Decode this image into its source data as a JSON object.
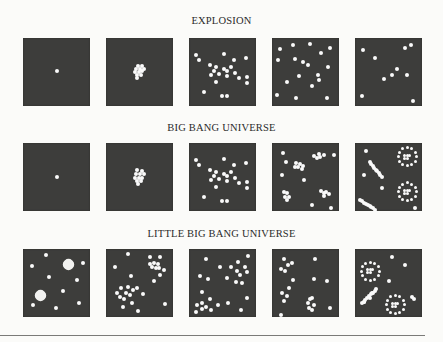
{
  "rows": [
    {
      "title": "EXPLOSION",
      "panels": [
        {
          "dots": [
            [
              50,
              49
            ]
          ]
        },
        {
          "dots": [
            [
              48,
              41
            ],
            [
              53,
              41
            ],
            [
              45,
              46
            ],
            [
              51,
              46
            ],
            [
              56,
              45
            ],
            [
              43,
              50
            ],
            [
              49,
              50
            ],
            [
              54,
              49
            ],
            [
              47,
              55
            ],
            [
              52,
              54
            ],
            [
              46,
              59
            ]
          ]
        },
        {
          "dots": [
            [
              11,
              25
            ],
            [
              15,
              32
            ],
            [
              52,
              23
            ],
            [
              67,
              33
            ],
            [
              85,
              29
            ],
            [
              31,
              39
            ],
            [
              41,
              42
            ],
            [
              52,
              45
            ],
            [
              62,
              42
            ],
            [
              37,
              48
            ],
            [
              57,
              48
            ],
            [
              45,
              53
            ],
            [
              68,
              51
            ],
            [
              33,
              55
            ],
            [
              56,
              56
            ],
            [
              74,
              59
            ],
            [
              86,
              57
            ],
            [
              86,
              66
            ],
            [
              41,
              64
            ],
            [
              22,
              80
            ],
            [
              49,
              85
            ],
            [
              57,
              85
            ]
          ]
        },
        {
          "dots": [
            [
              12,
              16
            ],
            [
              31,
              11
            ],
            [
              57,
              9
            ],
            [
              73,
              22
            ],
            [
              87,
              14
            ],
            [
              9,
              33
            ],
            [
              35,
              31
            ],
            [
              46,
              36
            ],
            [
              53,
              40
            ],
            [
              84,
              42
            ],
            [
              40,
              56
            ],
            [
              68,
              55
            ],
            [
              70,
              62
            ],
            [
              22,
              65
            ],
            [
              60,
              71
            ],
            [
              8,
              84
            ],
            [
              36,
              88
            ],
            [
              82,
              88
            ]
          ]
        },
        {
          "dots": [
            [
              12,
              17
            ],
            [
              74,
              14
            ],
            [
              84,
              10
            ],
            [
              30,
              30
            ],
            [
              62,
              46
            ],
            [
              44,
              60
            ],
            [
              55,
              55
            ],
            [
              77,
              55
            ],
            [
              10,
              85
            ],
            [
              87,
              93
            ]
          ]
        }
      ]
    },
    {
      "title": "BIG BANG UNIVERSE",
      "panels": [
        {
          "dots": [
            [
              50,
              50
            ]
          ]
        },
        {
          "dots": [
            [
              47,
              40
            ],
            [
              53,
              41
            ],
            [
              45,
              46
            ],
            [
              51,
              46
            ],
            [
              56,
              46
            ],
            [
              43,
              51
            ],
            [
              49,
              51
            ],
            [
              54,
              51
            ],
            [
              47,
              56
            ],
            [
              52,
              56
            ],
            [
              48,
              61
            ]
          ]
        },
        {
          "dots": [
            [
              11,
              25
            ],
            [
              15,
              32
            ],
            [
              52,
              23
            ],
            [
              67,
              33
            ],
            [
              85,
              29
            ],
            [
              31,
              39
            ],
            [
              41,
              42
            ],
            [
              52,
              45
            ],
            [
              62,
              42
            ],
            [
              37,
              48
            ],
            [
              57,
              48
            ],
            [
              45,
              53
            ],
            [
              68,
              51
            ],
            [
              33,
              55
            ],
            [
              56,
              56
            ],
            [
              74,
              59
            ],
            [
              86,
              57
            ],
            [
              86,
              66
            ],
            [
              41,
              64
            ],
            [
              22,
              80
            ],
            [
              49,
              85
            ],
            [
              57,
              85
            ]
          ]
        },
        {
          "dots": [
            [
              16,
              14
            ],
            [
              21,
              28
            ],
            [
              62,
              19
            ],
            [
              67,
              22
            ],
            [
              72,
              20
            ],
            [
              77,
              18
            ],
            [
              70,
              16
            ],
            [
              92,
              17
            ],
            [
              36,
              30
            ],
            [
              42,
              31
            ],
            [
              46,
              34
            ],
            [
              39,
              36
            ],
            [
              35,
              35
            ],
            [
              45,
              38
            ],
            [
              15,
              47
            ],
            [
              48,
              54
            ],
            [
              18,
              72
            ],
            [
              23,
              74
            ],
            [
              20,
              79
            ],
            [
              25,
              80
            ],
            [
              22,
              84
            ],
            [
              73,
              71
            ],
            [
              77,
              74
            ],
            [
              81,
              72
            ],
            [
              78,
              78
            ],
            [
              85,
              75
            ],
            [
              59,
              91
            ],
            [
              88,
              95
            ]
          ]
        },
        {
          "dots": [
            [
              16,
              12
            ],
            [
              14,
              47
            ],
            [
              40,
              66
            ],
            [
              90,
              95
            ]
          ],
          "rings": [
            [
              78,
              20
            ],
            [
              78,
              72
            ]
          ],
          "streams": [
            [
              [
                22,
                28
              ],
              [
                40,
                50
              ]
            ],
            [
              [
                8,
                84
              ],
              [
                30,
                98
              ]
            ]
          ]
        }
      ]
    },
    {
      "title": "LITTLE BIG BANG UNIVERSE",
      "panels": [
        {
          "dots": [
            [
              34,
              9
            ],
            [
              13,
              25
            ],
            [
              90,
              21
            ],
            [
              39,
              41
            ],
            [
              80,
              45
            ],
            [
              59,
              62
            ],
            [
              15,
              83
            ],
            [
              49,
              87
            ],
            [
              84,
              79
            ]
          ],
          "blobs": [
            [
              68,
              23,
              11
            ],
            [
              26,
              69,
              11
            ]
          ]
        },
        {
          "dots": [
            [
              33,
              8
            ],
            [
              65,
              12
            ],
            [
              80,
              12
            ],
            [
              13,
              27
            ],
            [
              37,
              40
            ],
            [
              16,
              64
            ],
            [
              23,
              57
            ],
            [
              33,
              56
            ],
            [
              40,
              60
            ],
            [
              30,
              64
            ],
            [
              36,
              68
            ],
            [
              21,
              70
            ],
            [
              27,
              73
            ],
            [
              47,
              57
            ],
            [
              55,
              66
            ],
            [
              39,
              79
            ],
            [
              25,
              86
            ],
            [
              48,
              91
            ],
            [
              88,
              81
            ],
            [
              72,
              47
            ],
            [
              65,
              22
            ],
            [
              71,
              20
            ],
            [
              77,
              22
            ],
            [
              68,
              27
            ],
            [
              74,
              28
            ],
            [
              79,
              28
            ],
            [
              86,
              31
            ],
            [
              80,
              38
            ]
          ]
        },
        {
          "dots": [
            [
              26,
              14
            ],
            [
              47,
              26
            ],
            [
              63,
              26
            ],
            [
              73,
              19
            ],
            [
              88,
              11
            ],
            [
              17,
              40
            ],
            [
              29,
              44
            ],
            [
              56,
              42
            ],
            [
              72,
              33
            ],
            [
              86,
              34
            ],
            [
              79,
              50
            ],
            [
              70,
              48
            ],
            [
              84,
              27
            ],
            [
              76,
              38
            ],
            [
              19,
              63
            ],
            [
              31,
              73
            ],
            [
              58,
              79
            ],
            [
              86,
              72
            ],
            [
              44,
              82
            ],
            [
              10,
              93
            ],
            [
              20,
              88
            ],
            [
              25,
              86
            ],
            [
              33,
              90
            ],
            [
              12,
              82
            ],
            [
              20,
              80
            ],
            [
              78,
              90
            ]
          ]
        },
        {
          "dots": [
            [
              18,
              14
            ],
            [
              24,
              23
            ],
            [
              30,
              20
            ],
            [
              14,
              30
            ],
            [
              20,
              32
            ],
            [
              64,
              14
            ],
            [
              32,
              45
            ],
            [
              62,
              44
            ],
            [
              82,
              47
            ],
            [
              25,
              58
            ],
            [
              15,
              65
            ],
            [
              22,
              69
            ],
            [
              18,
              76
            ],
            [
              56,
              74
            ],
            [
              60,
              72
            ],
            [
              54,
              80
            ],
            [
              62,
              82
            ],
            [
              55,
              87
            ],
            [
              60,
              90
            ],
            [
              86,
              87
            ],
            [
              14,
              97
            ]
          ]
        },
        {
          "dots": [
            [
              55,
              12
            ],
            [
              75,
              23
            ],
            [
              50,
              47
            ],
            [
              85,
              71
            ],
            [
              88,
              73
            ],
            [
              14,
              78
            ],
            [
              22,
              72
            ],
            [
              25,
              65
            ]
          ],
          "rings": [
            [
              23,
              33
            ],
            [
              60,
              82
            ]
          ],
          "streams": [
            [
              [
                10,
                80
              ],
              [
                32,
                59
              ]
            ]
          ]
        }
      ]
    }
  ],
  "colors": {
    "panel": "#3d3d3b",
    "dot": "#fafafa",
    "background": "#fbfbf9",
    "text": "#2a2a2a"
  }
}
